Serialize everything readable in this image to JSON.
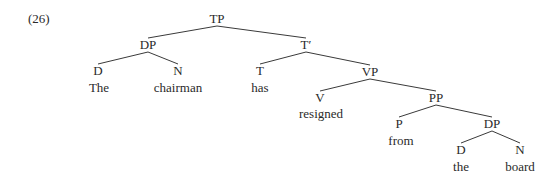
{
  "example_number": "(26)",
  "tree": {
    "nodes": [
      {
        "id": "TP",
        "label": "TP",
        "x": 217,
        "y": 19
      },
      {
        "id": "DP1",
        "label": "DP",
        "x": 148,
        "y": 45
      },
      {
        "id": "D1",
        "label": "D",
        "x": 98,
        "y": 71
      },
      {
        "id": "w1",
        "label": "The",
        "x": 99,
        "y": 88
      },
      {
        "id": "N1",
        "label": "N",
        "x": 178,
        "y": 71
      },
      {
        "id": "w2",
        "label": "chairman",
        "x": 178,
        "y": 88
      },
      {
        "id": "Tbar",
        "label": "T′",
        "x": 306,
        "y": 45
      },
      {
        "id": "T",
        "label": "T",
        "x": 260,
        "y": 71
      },
      {
        "id": "w3",
        "label": "has",
        "x": 260,
        "y": 88
      },
      {
        "id": "VP",
        "label": "VP",
        "x": 370,
        "y": 72
      },
      {
        "id": "V",
        "label": "V",
        "x": 320,
        "y": 98
      },
      {
        "id": "w4",
        "label": "resigned",
        "x": 321,
        "y": 114
      },
      {
        "id": "PP",
        "label": "PP",
        "x": 436,
        "y": 98
      },
      {
        "id": "P",
        "label": "P",
        "x": 399,
        "y": 124
      },
      {
        "id": "w5",
        "label": "from",
        "x": 401,
        "y": 141
      },
      {
        "id": "DP2",
        "label": "DP",
        "x": 492,
        "y": 124
      },
      {
        "id": "D2",
        "label": "D",
        "x": 461,
        "y": 150
      },
      {
        "id": "w6",
        "label": "the",
        "x": 461,
        "y": 167
      },
      {
        "id": "N2",
        "label": "N",
        "x": 520,
        "y": 150
      },
      {
        "id": "w7",
        "label": "board",
        "x": 520,
        "y": 167
      }
    ],
    "edges": [
      [
        "TP",
        "DP1"
      ],
      [
        "TP",
        "Tbar"
      ],
      [
        "DP1",
        "D1"
      ],
      [
        "DP1",
        "N1"
      ],
      [
        "Tbar",
        "T"
      ],
      [
        "Tbar",
        "VP"
      ],
      [
        "VP",
        "V"
      ],
      [
        "VP",
        "PP"
      ],
      [
        "PP",
        "P"
      ],
      [
        "PP",
        "DP2"
      ],
      [
        "DP2",
        "D2"
      ],
      [
        "DP2",
        "N2"
      ]
    ]
  }
}
